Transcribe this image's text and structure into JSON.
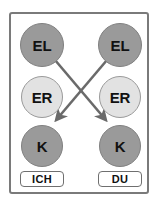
{
  "diagram": {
    "frame": {
      "border_color": "#7a7a7a",
      "background_color": "#ffffff"
    },
    "colors": {
      "node_dark": "#9a9a9a",
      "node_light": "#e2e2e2",
      "node_border_dark": "#808080",
      "node_border_light": "#9a9a9a",
      "arrow": "#6a6a6a",
      "text": "#111111",
      "pill_border": "#6f6f6f"
    },
    "columns": [
      {
        "id": "left",
        "label": "ICH",
        "nodes": [
          {
            "id": "el-left",
            "label": "EL",
            "shade": "dark"
          },
          {
            "id": "er-left",
            "label": "ER",
            "shade": "light"
          },
          {
            "id": "k-left",
            "label": "K",
            "shade": "dark"
          }
        ]
      },
      {
        "id": "right",
        "label": "DU",
        "nodes": [
          {
            "id": "el-right",
            "label": "EL",
            "shade": "dark"
          },
          {
            "id": "er-right",
            "label": "ER",
            "shade": "light"
          },
          {
            "id": "k-right",
            "label": "K",
            "shade": "dark"
          }
        ]
      }
    ],
    "arrows": [
      {
        "id": "el-left-to-k-right",
        "from": "el-left",
        "to": "k-right",
        "direction": "down-right",
        "head": "arrowhead"
      },
      {
        "id": "el-right-to-k-left",
        "from": "el-right",
        "to": "k-left",
        "direction": "down-left",
        "head": "arrowhead"
      }
    ]
  }
}
